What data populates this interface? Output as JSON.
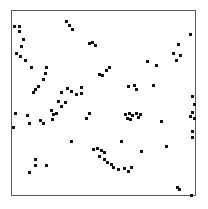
{
  "figure": {
    "type": "scatter-plot",
    "title": "",
    "frame": {
      "x": 11,
      "y": 10,
      "width": 185,
      "height": 186,
      "border_color": "#5b5b5b",
      "background": "#ffffff"
    },
    "point_style": {
      "color": "#121212",
      "size_px": 3,
      "shape": "square"
    }
  },
  "chart_data": {
    "type": "scatter",
    "title": "",
    "xlabel": "",
    "ylabel": "",
    "grid": false,
    "legend": null,
    "axis_ticks": {
      "x": [],
      "y": []
    },
    "xlim": [
      0,
      1
    ],
    "ylim": [
      0,
      1
    ],
    "n_points": 97,
    "series": [
      {
        "name": "points",
        "color": "#121212",
        "marker": "square",
        "points_px": [
          [
            13,
            25
          ],
          [
            18,
            25
          ],
          [
            18,
            30
          ],
          [
            20,
            45
          ],
          [
            15,
            52
          ],
          [
            19,
            55
          ],
          [
            24,
            59
          ],
          [
            65,
            20
          ],
          [
            68,
            24
          ],
          [
            71,
            28
          ],
          [
            88,
            42
          ],
          [
            91,
            41
          ],
          [
            94,
            44
          ],
          [
            108,
            66
          ],
          [
            189,
            33
          ],
          [
            177,
            43
          ],
          [
            172,
            52
          ],
          [
            179,
            54
          ],
          [
            175,
            59
          ],
          [
            45,
            66
          ],
          [
            44,
            72
          ],
          [
            42,
            78
          ],
          [
            37,
            85
          ],
          [
            34,
            88
          ],
          [
            32,
            91
          ],
          [
            60,
            91
          ],
          [
            66,
            87
          ],
          [
            70,
            90
          ],
          [
            75,
            93
          ],
          [
            80,
            86
          ],
          [
            80,
            92
          ],
          [
            98,
            73
          ],
          [
            101,
            74
          ],
          [
            105,
            69
          ],
          [
            127,
            85
          ],
          [
            133,
            84
          ],
          [
            135,
            88
          ],
          [
            152,
            84
          ],
          [
            124,
            113
          ],
          [
            128,
            112
          ],
          [
            131,
            114
          ],
          [
            126,
            117
          ],
          [
            129,
            118
          ],
          [
            135,
            112
          ],
          [
            137,
            116
          ],
          [
            139,
            113
          ],
          [
            14,
            112
          ],
          [
            12,
            126
          ],
          [
            26,
            114
          ],
          [
            28,
            122
          ],
          [
            39,
            119
          ],
          [
            42,
            122
          ],
          [
            50,
            109
          ],
          [
            52,
            113
          ],
          [
            51,
            118
          ],
          [
            55,
            112
          ],
          [
            191,
            95
          ],
          [
            193,
            103
          ],
          [
            191,
            111
          ],
          [
            189,
            115
          ],
          [
            193,
            117
          ],
          [
            191,
            130
          ],
          [
            191,
            136
          ],
          [
            92,
            148
          ],
          [
            96,
            147
          ],
          [
            100,
            149
          ],
          [
            103,
            151
          ],
          [
            98,
            155
          ],
          [
            103,
            158
          ],
          [
            106,
            161
          ],
          [
            110,
            163
          ],
          [
            112,
            166
          ],
          [
            117,
            168
          ],
          [
            123,
            167
          ],
          [
            127,
            170
          ],
          [
            130,
            166
          ],
          [
            34,
            158
          ],
          [
            34,
            164
          ],
          [
            45,
            164
          ],
          [
            28,
            171
          ],
          [
            176,
            186
          ],
          [
            178,
            188
          ],
          [
            190,
            194
          ],
          [
            60,
            105
          ],
          [
            64,
            101
          ],
          [
            57,
            100
          ],
          [
            30,
            66
          ],
          [
            22,
            38
          ],
          [
            85,
            117
          ],
          [
            88,
            112
          ],
          [
            146,
            60
          ],
          [
            155,
            64
          ],
          [
            120,
            140
          ],
          [
            140,
            150
          ],
          [
            70,
            140
          ],
          [
            160,
            120
          ],
          [
            165,
            145
          ]
        ]
      }
    ]
  }
}
